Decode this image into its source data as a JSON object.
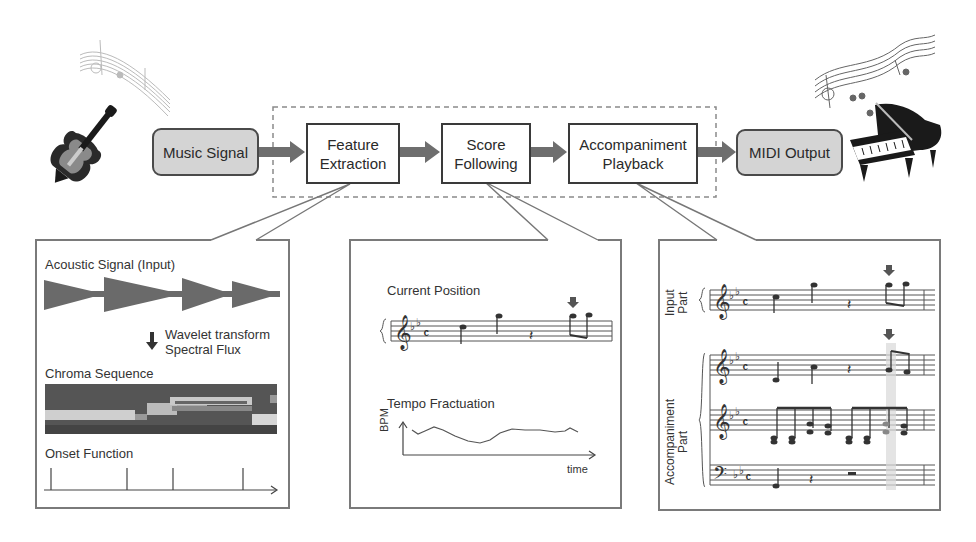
{
  "pipeline": {
    "input": {
      "label": "Music Signal"
    },
    "stages": [
      {
        "line1": "Feature",
        "line2": "Extraction"
      },
      {
        "line1": "Score",
        "line2": "Following"
      },
      {
        "line1": "Accompaniment",
        "line2": "Playback"
      }
    ],
    "output": {
      "label": "MIDI Output"
    }
  },
  "icons": {
    "input_icon": "violin-icon",
    "output_icon": "grand-piano-icon",
    "input_decoration": "music-notes-icon",
    "output_decoration": "music-notes-icon"
  },
  "feature_panel": {
    "acoustic_label": "Acoustic Signal (Input)",
    "transform_line1": "Wavelet transform",
    "transform_line2": "Spectral Flux",
    "chroma_label": "Chroma Sequence",
    "onset_label": "Onset Function"
  },
  "score_panel": {
    "position_label": "Current Position",
    "tempo_label": "Tempo Fractuation",
    "y_axis": "BPM",
    "x_axis": "time"
  },
  "accomp_panel": {
    "input_part_line1": "Input",
    "input_part_line2": "Part",
    "accomp_part_line1": "Accompaniment",
    "accomp_part_line2": "Part"
  },
  "colors": {
    "arrow": "#6e6e6e",
    "rounded_box_fill": "#d4d4d4",
    "border": "#3a3a3a",
    "panel_border": "#7a7a7a"
  }
}
